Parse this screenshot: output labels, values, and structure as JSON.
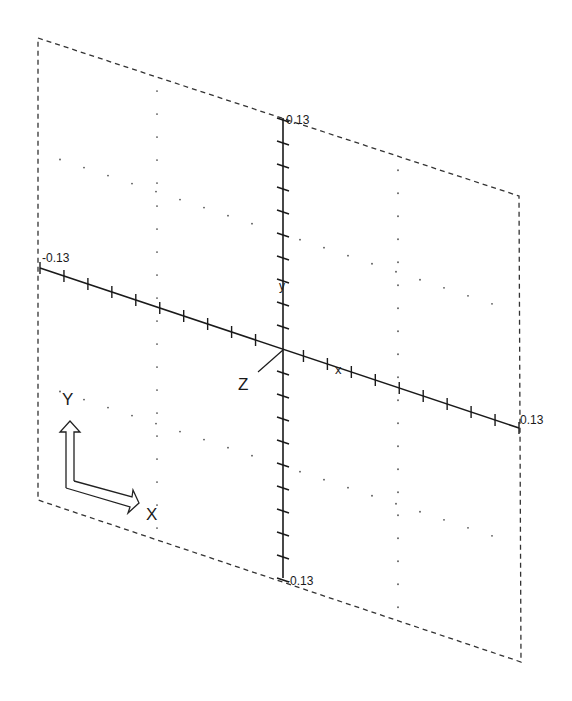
{
  "viewport": {
    "title": "Isometric workplane view",
    "frame": {
      "corners": [
        [
          38,
          38
        ],
        [
          519,
          196
        ],
        [
          521,
          662
        ],
        [
          38,
          500
        ]
      ],
      "style": "dashed",
      "color": "#333333"
    },
    "axes": {
      "origin": [
        283,
        350
      ],
      "vertical": {
        "top": [
          283,
          118
        ],
        "bottom": [
          283,
          578
        ],
        "max_label": "0.13",
        "min_label": "-0.13",
        "ticks_each_side": 10
      },
      "horizontal": {
        "left": [
          40,
          268
        ],
        "right": [
          519,
          428
        ],
        "min_label": "-0.13",
        "max_label": "0.13",
        "ticks_each_side": 10
      },
      "depth": {
        "from": [
          283,
          350
        ],
        "to": [
          258,
          372
        ],
        "label": "Z"
      },
      "markers": [
        {
          "glyph": "x",
          "at": [
            340,
            369
          ]
        },
        {
          "glyph": "y",
          "at": [
            283,
            284
          ]
        }
      ],
      "color": "#1a1a1a"
    },
    "grid": {
      "dot_color": "#555555",
      "vertical_dot_lines_x": [
        157,
        398
      ],
      "skew_dot_lines_offset": [
        -116,
        116
      ]
    },
    "triad": {
      "y_label": "Y",
      "x_label": "X"
    }
  }
}
